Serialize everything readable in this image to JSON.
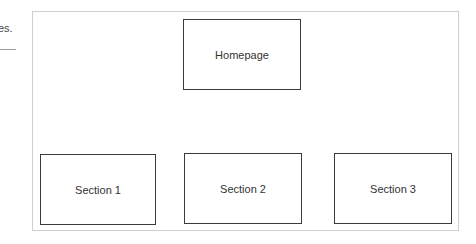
{
  "left_fragment": {
    "text": "es."
  },
  "diagram": {
    "root": {
      "label": "Homepage"
    },
    "children": [
      {
        "label": "Section 1"
      },
      {
        "label": "Section 2"
      },
      {
        "label": "Section 3"
      }
    ]
  }
}
